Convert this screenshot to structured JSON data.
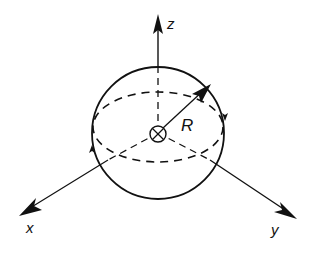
{
  "diagram": {
    "labels": {
      "z_axis": "z",
      "x_axis": "x",
      "y_axis": "y",
      "radius": "R"
    },
    "center_symbol": "into-page (circled cross)",
    "colors": {
      "stroke": "#111111",
      "background": "#ffffff"
    }
  }
}
